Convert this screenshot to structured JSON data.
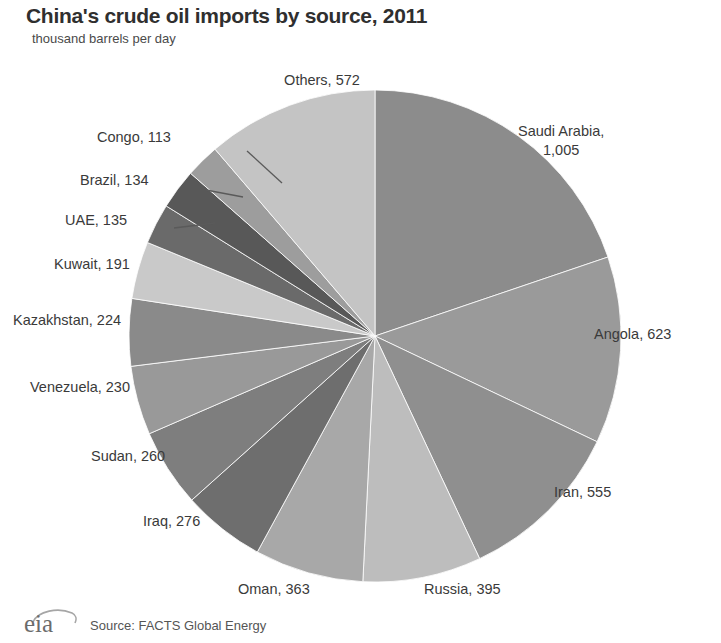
{
  "header": {
    "title": "China's crude oil imports by source, 2011",
    "subtitle": "thousand barrels per day"
  },
  "footer": {
    "logo_text": "eia",
    "source": "Source: FACTS Global Energy"
  },
  "chart_data": {
    "type": "pie",
    "title": "China's crude oil imports by source, 2011",
    "subtitle": "thousand barrels per day",
    "unit": "thousand barrels per day",
    "total": 5076,
    "start_angle_deg": 0,
    "direction": "clockwise",
    "legend": "none (direct labels with leader lines)",
    "grid": false,
    "categories": [
      "Saudi Arabia",
      "Angola",
      "Iran",
      "Russia",
      "Oman",
      "Iraq",
      "Sudan",
      "Venezuela",
      "Kazakhstan",
      "Kuwait",
      "UAE",
      "Brazil",
      "Congo",
      "Others"
    ],
    "values": [
      1005,
      623,
      555,
      395,
      363,
      276,
      260,
      230,
      224,
      191,
      135,
      134,
      113,
      572
    ],
    "slices": [
      {
        "label": "Saudi Arabia",
        "value": 1005,
        "value_text": "1,005",
        "label_text": "Saudi Arabia,",
        "color": "#8c8c8c"
      },
      {
        "label": "Angola",
        "value": 623,
        "value_text": "623",
        "label_text": "Angola, 623",
        "color": "#9a9a9a"
      },
      {
        "label": "Iran",
        "value": 555,
        "value_text": "555",
        "label_text": "Iran, 555",
        "color": "#8f8f8f"
      },
      {
        "label": "Russia",
        "value": 395,
        "value_text": "395",
        "label_text": "Russia, 395",
        "color": "#bdbdbd"
      },
      {
        "label": "Oman",
        "value": 363,
        "value_text": "363",
        "label_text": "Oman, 363",
        "color": "#a8a8a8"
      },
      {
        "label": "Iraq",
        "value": 276,
        "value_text": "276",
        "label_text": "Iraq, 276",
        "color": "#6e6e6e"
      },
      {
        "label": "Sudan",
        "value": 260,
        "value_text": "260",
        "label_text": "Sudan, 260",
        "color": "#7e7e7e"
      },
      {
        "label": "Venezuela",
        "value": 230,
        "value_text": "230",
        "label_text": "Venezuela, 230",
        "color": "#999999"
      },
      {
        "label": "Kazakhstan",
        "value": 224,
        "value_text": "224",
        "label_text": "Kazakhstan, 224",
        "color": "#8a8a8a"
      },
      {
        "label": "Kuwait",
        "value": 191,
        "value_text": "191",
        "label_text": "Kuwait, 191",
        "color": "#c9c9c9"
      },
      {
        "label": "UAE",
        "value": 135,
        "value_text": "135",
        "label_text": "UAE, 135",
        "color": "#6a6a6a"
      },
      {
        "label": "Brazil",
        "value": 134,
        "value_text": "134",
        "label_text": "Brazil, 134",
        "color": "#585858"
      },
      {
        "label": "Congo",
        "value": 113,
        "value_text": "113",
        "label_text": "Congo, 113",
        "color": "#9d9d9d"
      },
      {
        "label": "Others",
        "value": 572,
        "value_text": "572",
        "label_text": "Others, 572",
        "color": "#c4c4c4"
      }
    ]
  },
  "labels": {
    "saudi_line1": "Saudi Arabia,",
    "saudi_line2": "1,005",
    "angola": "Angola, 623",
    "iran": "Iran, 555",
    "russia": "Russia, 395",
    "oman": "Oman, 363",
    "iraq": "Iraq, 276",
    "sudan": "Sudan, 260",
    "venezuela": "Venezuela, 230",
    "kazakhstan": "Kazakhstan, 224",
    "kuwait": "Kuwait, 191",
    "uae": "UAE, 135",
    "brazil": "Brazil, 134",
    "congo": "Congo, 113",
    "others": "Others, 572"
  }
}
